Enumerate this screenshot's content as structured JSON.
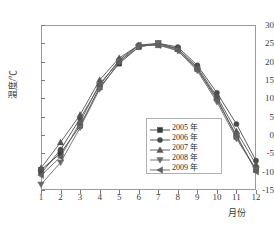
{
  "chart_data": {
    "type": "line",
    "title": "",
    "xlabel": "月份",
    "ylabel": "温度/℃",
    "categories": [
      1,
      2,
      3,
      4,
      5,
      6,
      7,
      8,
      9,
      10,
      11,
      12
    ],
    "xticklabels": [
      "1",
      "2",
      "3",
      "4",
      "5",
      "6",
      "7",
      "8",
      "9",
      "10",
      "11",
      "12"
    ],
    "yticklabels": [
      "-15",
      "-10",
      "-5",
      "0",
      "5",
      "10",
      "15",
      "20",
      "25",
      "30"
    ],
    "ytickvalues": [
      -15,
      -10,
      -5,
      0,
      5,
      10,
      15,
      20,
      25,
      30
    ],
    "xlim": [
      1,
      12
    ],
    "ylim": [
      -15,
      30
    ],
    "grid": false,
    "legend_position": "center-right",
    "series": [
      {
        "name": "2005 年",
        "marker": "square",
        "color": "#3c3c3c",
        "values": [
          -9.5,
          -5.0,
          2.5,
          13.0,
          19.5,
          24.0,
          25.0,
          23.5,
          18.0,
          10.0,
          -0.5,
          -9.5
        ]
      },
      {
        "name": "2006 年",
        "marker": "circle",
        "color": "#4a4a4a",
        "values": [
          -10.5,
          -4.0,
          4.5,
          13.5,
          20.5,
          24.5,
          25.0,
          24.0,
          19.0,
          11.5,
          3.0,
          -7.0
        ]
      },
      {
        "name": "2007 年",
        "marker": "triangle-up",
        "color": "#555555",
        "values": [
          -9.0,
          -2.0,
          5.5,
          15.0,
          21.0,
          24.5,
          24.5,
          23.5,
          18.5,
          10.5,
          1.0,
          -8.0
        ]
      },
      {
        "name": "2008 年",
        "marker": "triangle-down",
        "color": "#6a6a6a",
        "values": [
          -13.5,
          -7.5,
          2.0,
          12.5,
          20.0,
          24.0,
          25.0,
          23.0,
          17.5,
          9.0,
          -1.0,
          -9.5
        ]
      },
      {
        "name": "2009 年",
        "marker": "triangle-left",
        "color": "#606060",
        "values": [
          -11.0,
          -6.0,
          3.5,
          14.0,
          20.0,
          24.5,
          24.5,
          23.0,
          18.0,
          9.5,
          0.0,
          -10.0
        ]
      }
    ]
  },
  "axes": {
    "y_title": "温度/℃",
    "x_title": "月份"
  },
  "legend": {
    "items": [
      {
        "label": "2005 年"
      },
      {
        "label": "2006 年"
      },
      {
        "label": "2007 年"
      },
      {
        "label": "2008 年"
      },
      {
        "label": "2009 年"
      }
    ]
  }
}
